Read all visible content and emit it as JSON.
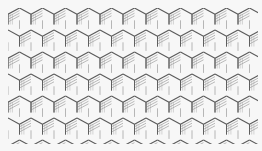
{
  "image": {
    "subject": "hexagonal lattice line illustration",
    "description": "Isometric line drawing of stacked hexagonal prisms forming a honeycomb crystal lattice",
    "colors": {
      "background": "#f7f7f7",
      "line": "#5a5a5a",
      "face": "#eeeeee"
    },
    "lattice": {
      "columns": 11,
      "rows": 6,
      "cell_width": 23,
      "cell_height": 22
    }
  }
}
